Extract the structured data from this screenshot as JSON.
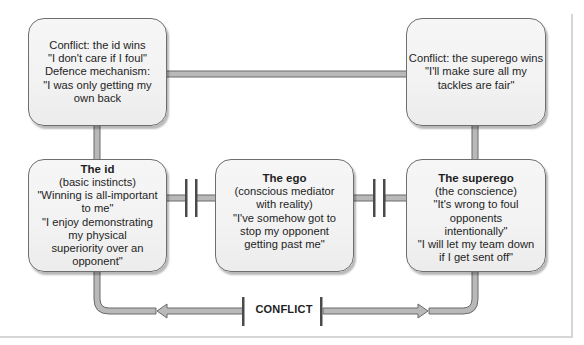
{
  "diagram": {
    "boxes": {
      "id_wins": {
        "lines": [
          "Conflict: the id wins",
          "\"I don't care if I foul\"",
          "Defence mechanism:",
          "\"I was only getting my",
          "own back"
        ]
      },
      "superego_wins": {
        "lines": [
          "Conflict: the superego wins",
          "\"I'll make sure all my",
          "tackles are fair\""
        ]
      },
      "id": {
        "title": "The id",
        "lines": [
          "(basic instincts)",
          "\"Winning is all-important",
          "to me\"",
          "\"I enjoy demonstrating",
          "my physical",
          "superiority over an opponent\""
        ]
      },
      "ego": {
        "title": "The ego",
        "lines": [
          "(conscious mediator",
          "with reality)",
          "\"I've somehow got to",
          "stop my opponent",
          "getting past me\""
        ]
      },
      "superego": {
        "title": "The superego",
        "lines": [
          "(the conscience)",
          "\"It's wrong to foul opponents",
          "intentionally\"",
          "\"I will let my team down",
          "if I get sent off\""
        ]
      }
    },
    "conflict_label": "CONFLICT",
    "colors": {
      "connector_fill": "#b9b9b9",
      "connector_stroke": "#6a6a6a",
      "box_border": "#6e6e6e",
      "box_fill": "#f3f3f3",
      "bar": "#4a4a4a"
    }
  }
}
